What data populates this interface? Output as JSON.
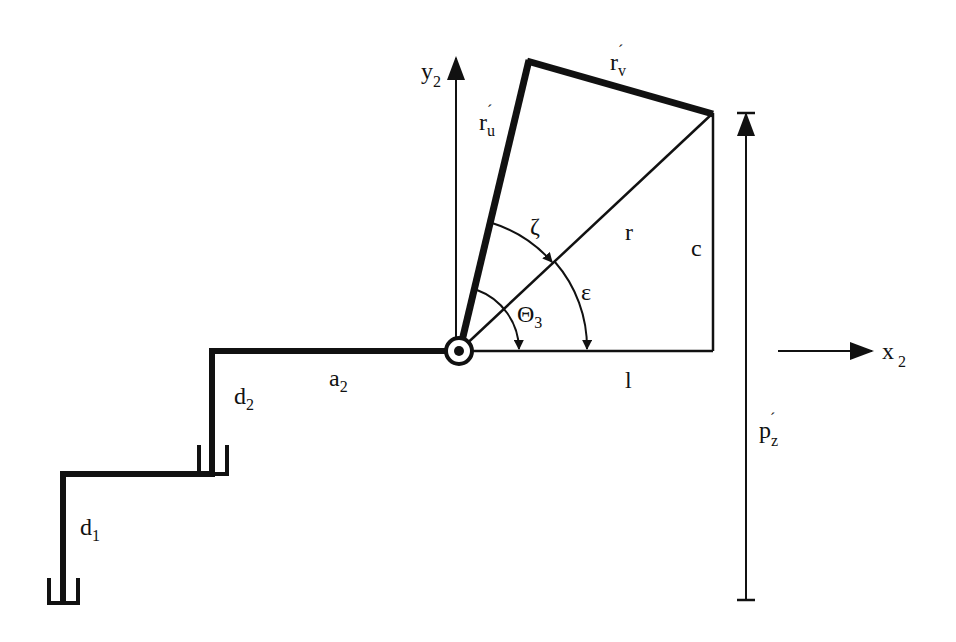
{
  "diagram": {
    "type": "robot-arm-kinematics",
    "colors": {
      "stroke": "#111111",
      "background": "#ffffff"
    },
    "labels": {
      "y_axis": {
        "base": "y",
        "sub": "2"
      },
      "x_axis": {
        "base": "x",
        "sub": "2"
      },
      "r_u": {
        "base": "r",
        "prime": "´",
        "sub": "u"
      },
      "r_v": {
        "base": "r",
        "prime": "´",
        "sub": "v"
      },
      "zeta": "ζ",
      "r": "r",
      "c": "c",
      "epsilon": "ε",
      "theta3": {
        "base": "Θ",
        "sub": "3"
      },
      "l": "l",
      "a2": {
        "base": "a",
        "sub": "2"
      },
      "d2": {
        "base": "d",
        "sub": "2"
      },
      "d1": {
        "base": "d",
        "sub": "1"
      },
      "p_z": {
        "base": "p",
        "prime": "´",
        "sub": "z"
      }
    },
    "points": {
      "joint": [
        459,
        351
      ],
      "top_apex": [
        529,
        60
      ],
      "right_apex": [
        713,
        113
      ],
      "right_foot": [
        713,
        351
      ]
    }
  }
}
